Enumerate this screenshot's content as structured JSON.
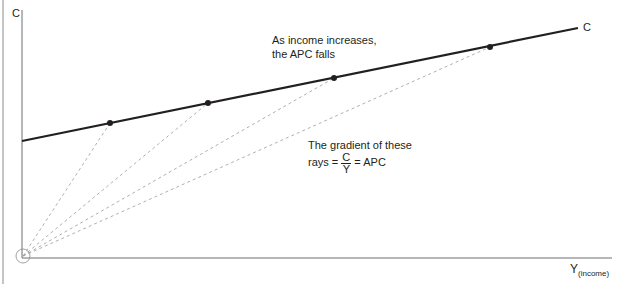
{
  "diagram": {
    "y_axis_label": "C",
    "x_axis_label": "Y",
    "x_axis_sub": "(income)",
    "line_label": "C",
    "annotation_top_line1": "As income increases,",
    "annotation_top_line2": "the APC falls",
    "annotation_gradient_line1": "The gradient of these",
    "annotation_gradient_prefix": "rays =",
    "fraction_num": "C",
    "fraction_den": "Y",
    "annotation_gradient_suffix": "= APC",
    "points": [
      {
        "x": 110,
        "y": 123
      },
      {
        "x": 208,
        "y": 103
      },
      {
        "x": 334,
        "y": 78
      },
      {
        "x": 490,
        "y": 47
      }
    ],
    "colors": {
      "line": "#231f20",
      "rays": "#9a9a9a",
      "axis": "#6d6e71"
    }
  }
}
